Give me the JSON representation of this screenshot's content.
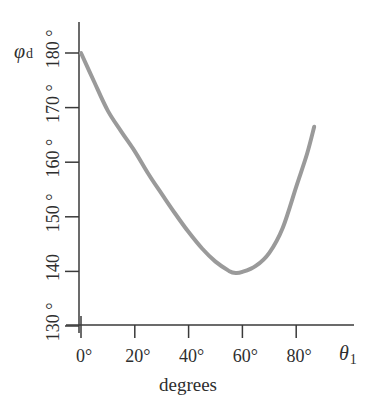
{
  "chart_data": {
    "type": "line",
    "title": "",
    "xlabel": "degrees",
    "x_symbol": "θ",
    "x_symbol_sub": "1",
    "ylabel": "",
    "y_symbol": "φ",
    "y_symbol_sub": "d",
    "xlim": [
      0,
      90
    ],
    "ylim": [
      130,
      185
    ],
    "x_ticks": [
      0,
      20,
      40,
      60,
      80
    ],
    "x_tick_labels": [
      "0°",
      "20°",
      "40°",
      "60°",
      "80°"
    ],
    "y_ticks": [
      130,
      140,
      150,
      160,
      170,
      180
    ],
    "y_tick_labels": [
      "130 °",
      "140",
      "150 °",
      "160 °",
      "170 °",
      "180 °"
    ],
    "grid": false,
    "legend": null,
    "series": [
      {
        "name": "phi_d vs theta_1",
        "color": "#9a9a9a",
        "x": [
          0,
          5,
          10,
          15,
          20,
          25,
          30,
          35,
          40,
          45,
          50,
          55,
          57.5,
          60,
          65,
          70,
          75,
          80,
          84,
          86.7
        ],
        "y": [
          180,
          174.6,
          169.4,
          165.6,
          162.0,
          157.9,
          154.2,
          150.6,
          147.2,
          144.2,
          141.8,
          140.1,
          139.7,
          139.9,
          141.0,
          143.4,
          148.0,
          155.5,
          161.5,
          166.5
        ]
      }
    ]
  },
  "labels": {
    "y_axis_symbol": "φ",
    "y_axis_sub": "d",
    "x_axis_symbol": "θ",
    "x_axis_sub": "1",
    "x_axis_title": "degrees"
  }
}
